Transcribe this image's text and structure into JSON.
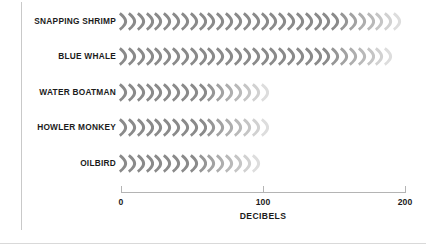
{
  "chart_data": {
    "type": "bar",
    "title": "",
    "subtitle": "",
    "xlabel": "DECIBELS",
    "ylabel": "",
    "xlim": [
      0,
      200
    ],
    "xticks": [
      0,
      100,
      200
    ],
    "xtick_labels": [
      "0",
      "100",
      "200"
    ],
    "grid": false,
    "legend": null,
    "pictogram": {
      "icon": "sound-wave-arc-icon",
      "unit_value": 7,
      "color": "#8a8a8a",
      "fade": "icons fade to lighter gray toward the end of each row"
    },
    "categories": [
      "SNAPPING SHRIMP",
      "BLUE WHALE",
      "WATER BOATMAN",
      "HOWLER MONKEY",
      "OILBIRD"
    ],
    "values": [
      200,
      188,
      105,
      105,
      100
    ],
    "icon_counts": [
      32,
      31,
      17,
      17,
      16
    ],
    "series": [
      {
        "name": "Loudness",
        "values": [
          200,
          188,
          105,
          105,
          100
        ]
      }
    ]
  },
  "chart": {
    "axis_title": "DECIBELS",
    "ticks": [
      {
        "label": "0",
        "value": 0
      },
      {
        "label": "100",
        "value": 100
      },
      {
        "label": "200",
        "value": 200
      }
    ],
    "rows": [
      {
        "label": "SNAPPING SHRIMP",
        "value": 200,
        "icons": 32
      },
      {
        "label": "BLUE WHALE",
        "value": 188,
        "icons": 31
      },
      {
        "label": "WATER BOATMAN",
        "value": 105,
        "icons": 17
      },
      {
        "label": "HOWLER MONKEY",
        "value": 105,
        "icons": 17
      },
      {
        "label": "OILBIRD",
        "value": 100,
        "icons": 16
      }
    ]
  },
  "colors": {
    "icon": "#8a8a8a",
    "icon_faded": "#d8d8d8",
    "text": "#1b1b1b",
    "axis": "#b4b4b4",
    "rule": "#c9c9c9",
    "background": "#ffffff"
  }
}
